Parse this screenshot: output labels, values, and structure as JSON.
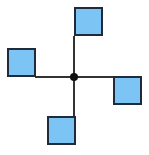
{
  "diagram": {
    "type": "pinwheel",
    "colors": {
      "fill": "#7cc4f4",
      "stroke": "#1f2a3a",
      "line": "#333333",
      "hub": "#111111"
    },
    "hub": {
      "cx": 74,
      "cy": 77,
      "r": 4
    },
    "arms": [
      {
        "name": "arm-up",
        "x1": 74,
        "y1": 77,
        "x2": 74,
        "y2": 36
      },
      {
        "name": "arm-left",
        "x1": 74,
        "y1": 77,
        "x2": 35,
        "y2": 77
      },
      {
        "name": "arm-right",
        "x1": 74,
        "y1": 77,
        "x2": 114,
        "y2": 77
      },
      {
        "name": "arm-down",
        "x1": 74,
        "y1": 77,
        "x2": 74,
        "y2": 117
      }
    ],
    "squares": [
      {
        "name": "square-top",
        "x": 75,
        "y": 8,
        "size": 27
      },
      {
        "name": "square-left",
        "x": 8,
        "y": 49,
        "size": 27
      },
      {
        "name": "square-right",
        "x": 114,
        "y": 77,
        "size": 27
      },
      {
        "name": "square-bottom",
        "x": 48,
        "y": 117,
        "size": 27
      }
    ]
  }
}
